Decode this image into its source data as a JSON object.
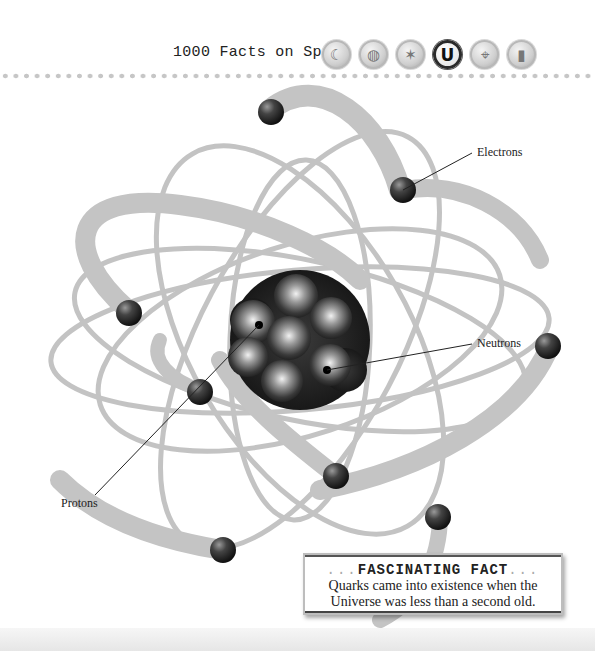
{
  "header": {
    "title": "1000 Facts on Space",
    "nav_buttons": [
      {
        "name": "moon",
        "glyph": "☾",
        "active": false
      },
      {
        "name": "planet",
        "glyph": "◍",
        "active": false
      },
      {
        "name": "star",
        "glyph": "✶",
        "active": false
      },
      {
        "name": "universe",
        "glyph": "U",
        "active": true
      },
      {
        "name": "telescope",
        "glyph": "⌖",
        "active": false
      },
      {
        "name": "rocket",
        "glyph": "▮",
        "active": false
      }
    ]
  },
  "diagram": {
    "labels": {
      "electrons": "Electrons",
      "neutrons": "Neutrons",
      "protons": "Protons"
    }
  },
  "fact_box": {
    "dots_left": "...",
    "heading": "FASCINATING FACT",
    "dots_right": "...",
    "line1": "Quarks came into existence when the",
    "line2": "Universe was less than a second old."
  },
  "colors": {
    "ring": "#b5b5b5",
    "ball": "#2b2b2b",
    "text": "#222222"
  }
}
